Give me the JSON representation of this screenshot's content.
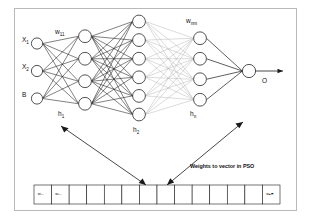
{
  "diagram": {
    "caption": "Weights to vector in PSO",
    "output_label": "O",
    "input_labels": [
      "X1",
      "X2",
      "B"
    ],
    "input_labels_display": [
      "X₁",
      "X₂",
      "B"
    ],
    "layer_labels": [
      "h₁",
      "h₂",
      "hₙ"
    ],
    "weight_labels": [
      "w₁₁",
      "wₙₘ"
    ],
    "layers": [
      {
        "name": "input",
        "label": "",
        "nodes": 3
      },
      {
        "name": "hidden-1",
        "label": "h₁",
        "nodes": 4
      },
      {
        "name": "hidden-2",
        "label": "h₂",
        "nodes": 6
      },
      {
        "name": "hidden-n",
        "label": "hₙ",
        "nodes": 4
      },
      {
        "name": "output",
        "label": "O",
        "nodes": 1
      }
    ],
    "vector": {
      "cell_count": 14,
      "cells": [
        "w₁₁",
        "w₂₁",
        "",
        "",
        "",
        "",
        "",
        "",
        "",
        "",
        "",
        "",
        "",
        "wₙₘ"
      ]
    },
    "colors": {
      "stroke": "#1a1a1a",
      "faded_stroke": "#b0b0b0",
      "node_fill": "#ffffff",
      "frame": "#b9b9b9",
      "background": "#ffffff"
    }
  }
}
